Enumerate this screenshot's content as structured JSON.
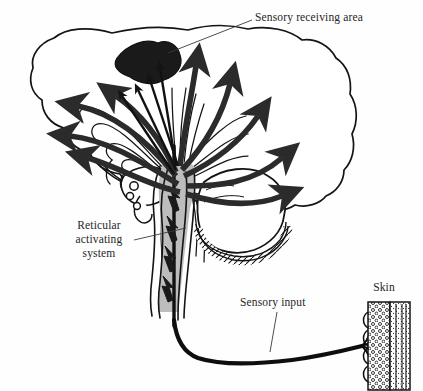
{
  "figure": {
    "type": "anatomical-line-diagram",
    "width": 423,
    "height": 391,
    "background_color": "#fefefe"
  },
  "labels": {
    "sensory_receiving_area": "Sensory receiving area",
    "reticular_activating_system_line1": "Reticular",
    "reticular_activating_system_line2": "activating",
    "reticular_activating_system_line3": "system",
    "sensory_input": "Sensory input",
    "skin": "Skin"
  },
  "colors": {
    "outline": "#141414",
    "ink": "#262626",
    "arrow_fill": "#2b2b2b",
    "receiving_area_fill": "#1a1a1a",
    "brainstem_fill": "#bdbdbd",
    "paper": "#fefefe",
    "leader_line": "#3a3a3a"
  },
  "structures": {
    "cerebrum": "cerebral-cortex-outline",
    "sensory_receiving_area": "dark-shaded-cortical-blob",
    "brainstem": "gray-shaded-brainstem-and-spinal-cord",
    "cerebellum": "hatched-border-cerebellum",
    "thalamus": "thalamus-outline",
    "radiating_arrows_count": 10,
    "ascending_zigzag_arrows_count": 4,
    "sensory_nerve": "thick-black-afferent-fiber",
    "skin_receptor": "skin-strip-with-branching-nerve-endings"
  }
}
